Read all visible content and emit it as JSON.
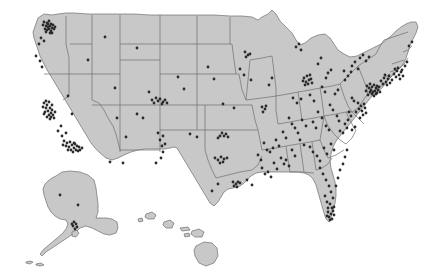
{
  "figure": {
    "type": "dot-density-map",
    "region_label": "United States",
    "title": "",
    "background_color": "#ffffff",
    "land_color": "#c8c8c8",
    "border_color": "#6e6e6e",
    "dot_color": "#2b2b2b",
    "dot_radius": 1.4,
    "insets": [
      "alaska",
      "hawaii"
    ]
  },
  "chart_data": {
    "type": "scatter",
    "title": "",
    "xlabel": "",
    "ylabel": "",
    "grid": false,
    "legend": "none",
    "xlim": [
      0,
      441
    ],
    "ylim": [
      0,
      278
    ],
    "note": "Dot locations in figure pixel coordinates; each dot marks one site.",
    "series": [
      {
        "name": "sites",
        "color": "#2b2b2b",
        "points": [
          [
            44,
            22
          ],
          [
            47,
            23
          ],
          [
            49,
            21
          ],
          [
            51,
            24
          ],
          [
            46,
            26
          ],
          [
            48,
            27
          ],
          [
            50,
            26
          ],
          [
            52,
            28
          ],
          [
            45,
            29
          ],
          [
            47,
            30
          ],
          [
            49,
            29
          ],
          [
            51,
            31
          ],
          [
            53,
            25
          ],
          [
            54,
            29
          ],
          [
            55,
            27
          ],
          [
            43,
            25
          ],
          [
            50,
            33
          ],
          [
            46,
            32
          ],
          [
            52,
            33
          ],
          [
            48,
            24
          ],
          [
            41,
            38
          ],
          [
            39,
            44
          ],
          [
            44,
            41
          ],
          [
            36,
            56
          ],
          [
            40,
            61
          ],
          [
            42,
            67
          ],
          [
            105,
            37
          ],
          [
            137,
            48
          ],
          [
            88,
            60
          ],
          [
            44,
            103
          ],
          [
            47,
            105
          ],
          [
            49,
            102
          ],
          [
            46,
            108
          ],
          [
            50,
            108
          ],
          [
            48,
            111
          ],
          [
            51,
            113
          ],
          [
            45,
            112
          ],
          [
            49,
            115
          ],
          [
            52,
            110
          ],
          [
            53,
            115
          ],
          [
            47,
            117
          ],
          [
            50,
            119
          ],
          [
            54,
            118
          ],
          [
            43,
            107
          ],
          [
            46,
            101
          ],
          [
            52,
            105
          ],
          [
            55,
            112
          ],
          [
            51,
            117
          ],
          [
            44,
            114
          ],
          [
            58,
            131
          ],
          [
            62,
            136
          ],
          [
            64,
            141
          ],
          [
            67,
            143
          ],
          [
            70,
            142
          ],
          [
            66,
            146
          ],
          [
            69,
            147
          ],
          [
            72,
            145
          ],
          [
            74,
            143
          ],
          [
            71,
            150
          ],
          [
            74,
            148
          ],
          [
            77,
            146
          ],
          [
            76,
            150
          ],
          [
            79,
            147
          ],
          [
            73,
            152
          ],
          [
            68,
            150
          ],
          [
            80,
            150
          ],
          [
            82,
            148
          ],
          [
            63,
            145
          ],
          [
            75,
            144
          ],
          [
            78,
            151
          ],
          [
            61,
            126
          ],
          [
            66,
            133
          ],
          [
            68,
            96
          ],
          [
            72,
            114
          ],
          [
            115,
            88
          ],
          [
            126,
            137
          ],
          [
            117,
            118
          ],
          [
            110,
            162
          ],
          [
            123,
            163
          ],
          [
            152,
            100
          ],
          [
            156,
            98
          ],
          [
            158,
            101
          ],
          [
            154,
            103
          ],
          [
            160,
            99
          ],
          [
            162,
            104
          ],
          [
            165,
            100
          ],
          [
            163,
            102
          ],
          [
            149,
            92
          ],
          [
            167,
            103
          ],
          [
            137,
            114
          ],
          [
            143,
            118
          ],
          [
            158,
            133
          ],
          [
            163,
            136
          ],
          [
            160,
            140
          ],
          [
            162,
            146
          ],
          [
            165,
            144
          ],
          [
            163,
            152
          ],
          [
            161,
            158
          ],
          [
            156,
            163
          ],
          [
            220,
            136
          ],
          [
            222,
            133
          ],
          [
            224,
            136
          ],
          [
            226,
            134
          ],
          [
            228,
            137
          ],
          [
            218,
            138
          ],
          [
            215,
            158
          ],
          [
            218,
            160
          ],
          [
            221,
            157
          ],
          [
            224,
            159
          ],
          [
            227,
            158
          ],
          [
            223,
            162
          ],
          [
            220,
            163
          ],
          [
            233,
            182
          ],
          [
            236,
            184
          ],
          [
            238,
            182
          ],
          [
            234,
            186
          ],
          [
            237,
            187
          ],
          [
            240,
            183
          ],
          [
            218,
            184
          ],
          [
            212,
            191
          ],
          [
            247,
            180
          ],
          [
            252,
            185
          ],
          [
            190,
            134
          ],
          [
            197,
            137
          ],
          [
            223,
            104
          ],
          [
            234,
            108
          ],
          [
            178,
            77
          ],
          [
            184,
            89
          ],
          [
            208,
            67
          ],
          [
            214,
            79
          ],
          [
            245,
            52
          ],
          [
            248,
            55
          ],
          [
            246,
            57
          ],
          [
            250,
            54
          ],
          [
            240,
            69
          ],
          [
            244,
            75
          ],
          [
            251,
            80
          ],
          [
            262,
            107
          ],
          [
            265,
            109
          ],
          [
            263,
            112
          ],
          [
            266,
            106
          ],
          [
            272,
            78
          ],
          [
            269,
            85
          ],
          [
            304,
            78
          ],
          [
            307,
            76
          ],
          [
            309,
            80
          ],
          [
            306,
            82
          ],
          [
            311,
            79
          ],
          [
            308,
            84
          ],
          [
            305,
            85
          ],
          [
            312,
            83
          ],
          [
            303,
            81
          ],
          [
            310,
            75
          ],
          [
            296,
            47
          ],
          [
            299,
            44
          ],
          [
            301,
            50
          ],
          [
            318,
            64
          ],
          [
            321,
            58
          ],
          [
            328,
            73
          ],
          [
            331,
            70
          ],
          [
            326,
            78
          ],
          [
            293,
            98
          ],
          [
            297,
            103
          ],
          [
            301,
            99
          ],
          [
            310,
            95
          ],
          [
            314,
            101
          ],
          [
            322,
            87
          ],
          [
            325,
            92
          ],
          [
            335,
            94
          ],
          [
            338,
            90
          ],
          [
            345,
            80
          ],
          [
            348,
            76
          ],
          [
            344,
            71
          ],
          [
            352,
            66
          ],
          [
            355,
            62
          ],
          [
            358,
            69
          ],
          [
            351,
            72
          ],
          [
            360,
            58
          ],
          [
            363,
            55
          ],
          [
            366,
            61
          ],
          [
            369,
            57
          ],
          [
            370,
            84
          ],
          [
            372,
            87
          ],
          [
            374,
            85
          ],
          [
            376,
            88
          ],
          [
            371,
            90
          ],
          [
            373,
            92
          ],
          [
            375,
            91
          ],
          [
            377,
            86
          ],
          [
            369,
            88
          ],
          [
            378,
            90
          ],
          [
            372,
            94
          ],
          [
            376,
            94
          ],
          [
            374,
            96
          ],
          [
            370,
            92
          ],
          [
            379,
            87
          ],
          [
            366,
            91
          ],
          [
            368,
            95
          ],
          [
            380,
            92
          ],
          [
            367,
            86
          ],
          [
            377,
            93
          ],
          [
            381,
            81
          ],
          [
            384,
            78
          ],
          [
            386,
            82
          ],
          [
            388,
            79
          ],
          [
            390,
            83
          ],
          [
            383,
            84
          ],
          [
            387,
            85
          ],
          [
            392,
            80
          ],
          [
            385,
            75
          ],
          [
            389,
            76
          ],
          [
            394,
            74
          ],
          [
            397,
            71
          ],
          [
            399,
            75
          ],
          [
            396,
            77
          ],
          [
            401,
            72
          ],
          [
            398,
            68
          ],
          [
            403,
            76
          ],
          [
            400,
            79
          ],
          [
            395,
            69
          ],
          [
            402,
            70
          ],
          [
            405,
            66
          ],
          [
            407,
            62
          ],
          [
            409,
            46
          ],
          [
            412,
            42
          ],
          [
            358,
            103
          ],
          [
            361,
            106
          ],
          [
            364,
            104
          ],
          [
            359,
            109
          ],
          [
            362,
            111
          ],
          [
            365,
            108
          ],
          [
            356,
            112
          ],
          [
            363,
            115
          ],
          [
            360,
            118
          ],
          [
            366,
            113
          ],
          [
            352,
            98
          ],
          [
            354,
            101
          ],
          [
            349,
            112
          ],
          [
            351,
            116
          ],
          [
            348,
            120
          ],
          [
            345,
            124
          ],
          [
            347,
            128
          ],
          [
            343,
            133
          ],
          [
            340,
            131
          ],
          [
            352,
            130
          ],
          [
            355,
            127
          ],
          [
            337,
            116
          ],
          [
            339,
            121
          ],
          [
            330,
            105
          ],
          [
            333,
            110
          ],
          [
            318,
            112
          ],
          [
            322,
            118
          ],
          [
            326,
            126
          ],
          [
            329,
            130
          ],
          [
            313,
            122
          ],
          [
            316,
            128
          ],
          [
            302,
            120
          ],
          [
            306,
            126
          ],
          [
            295,
            128
          ],
          [
            298,
            133
          ],
          [
            289,
            118
          ],
          [
            292,
            124
          ],
          [
            283,
            132
          ],
          [
            286,
            138
          ],
          [
            276,
            140
          ],
          [
            279,
            146
          ],
          [
            270,
            152
          ],
          [
            273,
            148
          ],
          [
            264,
            143
          ],
          [
            267,
            150
          ],
          [
            258,
            155
          ],
          [
            261,
            160
          ],
          [
            300,
            140
          ],
          [
            304,
            145
          ],
          [
            310,
            147
          ],
          [
            313,
            152
          ],
          [
            317,
            156
          ],
          [
            320,
            161
          ],
          [
            324,
            148
          ],
          [
            327,
            154
          ],
          [
            331,
            144
          ],
          [
            334,
            150
          ],
          [
            292,
            150
          ],
          [
            295,
            156
          ],
          [
            286,
            160
          ],
          [
            289,
            166
          ],
          [
            281,
            158
          ],
          [
            284,
            164
          ],
          [
            274,
            163
          ],
          [
            277,
            169
          ],
          [
            268,
            172
          ],
          [
            271,
            177
          ],
          [
            262,
            168
          ],
          [
            265,
            174
          ],
          [
            320,
            168
          ],
          [
            323,
            174
          ],
          [
            326,
            180
          ],
          [
            329,
            186
          ],
          [
            331,
            192
          ],
          [
            333,
            198
          ],
          [
            330,
            204
          ],
          [
            332,
            208
          ],
          [
            328,
            212
          ],
          [
            331,
            214
          ],
          [
            329,
            217
          ],
          [
            333,
            211
          ],
          [
            330,
            220
          ],
          [
            327,
            216
          ],
          [
            334,
            215
          ],
          [
            332,
            219
          ],
          [
            328,
            208
          ],
          [
            334,
            207
          ],
          [
            325,
            196
          ],
          [
            327,
            202
          ],
          [
            336,
            186
          ],
          [
            338,
            178
          ],
          [
            340,
            170
          ],
          [
            343,
            164
          ],
          [
            345,
            157
          ],
          [
            347,
            150
          ],
          [
            78,
            205
          ],
          [
            74,
            222
          ],
          [
            76,
            224
          ],
          [
            73,
            226
          ],
          [
            77,
            227
          ],
          [
            75,
            229
          ],
          [
            72,
            224
          ],
          [
            60,
            195
          ]
        ]
      }
    ]
  }
}
